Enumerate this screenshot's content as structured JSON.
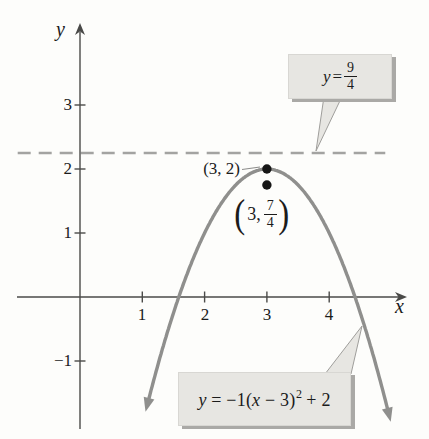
{
  "figure": {
    "background": "#fdfdfb",
    "axis_color": "#4a4a48",
    "curve_color": "#8f8f8d",
    "dash_color": "#a3a3a1",
    "point_color": "#161616",
    "box_fill": "#e7e6e2",
    "pointer_stroke": "#9f9e9b",
    "leader_color": "#8d8d8b"
  },
  "axes": {
    "x_label": "x",
    "y_label": "y",
    "x_tick_labels": [
      "1",
      "2",
      "3",
      "4"
    ],
    "y_tick_labels": [
      "3",
      "2",
      "1",
      "−1"
    ]
  },
  "annotations": {
    "point1_label": "(3, 2)",
    "point2": {
      "open": "(",
      "pre": "3,",
      "num": "7",
      "den": "4",
      "close": ")"
    },
    "box1": {
      "lhs": "y",
      "eq": " = ",
      "num": "9",
      "den": "4"
    },
    "box2": {
      "p1": "y",
      "p2": " = −1(",
      "p3": "x",
      "p4": " − 3)",
      "sup": "2",
      "p5": " + 2"
    }
  },
  "chart_data": {
    "type": "line",
    "title": "",
    "xlabel": "x",
    "ylabel": "y",
    "grid": false,
    "xlim": [
      -1.02,
      5.25
    ],
    "ylim": [
      -2.1,
      4.27
    ],
    "x_ticks": [
      1,
      2,
      3,
      4
    ],
    "y_ticks": [
      -1,
      1,
      2,
      3
    ],
    "curves": [
      {
        "name": "parabola",
        "label": "y = −1(x − 3)² + 2",
        "form": "a(x−h)²+k",
        "a": -1,
        "h": 3,
        "k": 2,
        "x_domain": [
          1.08,
          4.96
        ],
        "style": "solid",
        "arrows": "both-ends",
        "vertex": [
          3,
          2
        ],
        "x_intercepts": [
          1.586,
          4.414
        ]
      },
      {
        "name": "horizontal-line",
        "label": "y = 9/4",
        "y": 2.25,
        "x_domain": [
          -1.0,
          4.9
        ],
        "style": "dashed"
      }
    ],
    "points": [
      {
        "x": 3,
        "y": 2,
        "label": "(3, 2)"
      },
      {
        "x": 3,
        "y": 1.75,
        "label": "(3, 7/4)"
      }
    ]
  }
}
